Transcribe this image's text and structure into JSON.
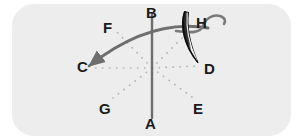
{
  "figure": {
    "name": "suture-needle-direction-diagram",
    "background_color": "#ededed",
    "outside_color": "#ffffff",
    "corner_radius": 22,
    "panel": {
      "x": 12,
      "y": 4,
      "width": 279,
      "height": 132
    }
  },
  "colors": {
    "panel_bg": "#ededed",
    "label_text": "#1a1a1a",
    "solid_line": "#6e6e6e",
    "dotted_line": "#b3b3b3",
    "needle_outline": "#111111",
    "needle_fill": "#f2f2f2",
    "thread": "#7a7a7a"
  },
  "labels": [
    {
      "id": "A",
      "text": "A",
      "x": 145,
      "y": 116,
      "name": "label-point-a"
    },
    {
      "id": "B",
      "text": "B",
      "x": 146,
      "y": 5,
      "name": "label-point-b"
    },
    {
      "id": "C",
      "text": "C",
      "x": 77,
      "y": 59,
      "name": "label-point-c"
    },
    {
      "id": "D",
      "text": "D",
      "x": 204,
      "y": 61,
      "name": "label-point-d"
    },
    {
      "id": "E",
      "text": "E",
      "x": 193,
      "y": 101,
      "name": "label-point-e"
    },
    {
      "id": "F",
      "text": "F",
      "x": 103,
      "y": 20,
      "name": "label-point-f"
    },
    {
      "id": "G",
      "text": "G",
      "x": 99,
      "y": 101,
      "name": "label-point-g"
    },
    {
      "id": "H",
      "text": "H",
      "x": 196,
      "y": 15,
      "name": "label-point-h"
    }
  ],
  "geometry": {
    "center": {
      "x": 152,
      "y": 68
    },
    "vertical_axis": {
      "from": {
        "x": 152,
        "y": 14
      },
      "to": {
        "x": 152,
        "y": 118
      }
    },
    "dotted_rays": [
      {
        "name": "ray-center-to-c",
        "to": {
          "x": 92,
          "y": 68
        }
      },
      {
        "name": "ray-center-to-d",
        "to": {
          "x": 200,
          "y": 66
        }
      },
      {
        "name": "ray-center-to-f",
        "to": {
          "x": 114,
          "y": 29
        }
      },
      {
        "name": "ray-center-to-e",
        "to": {
          "x": 192,
          "y": 97
        }
      },
      {
        "name": "ray-center-to-g",
        "to": {
          "x": 113,
          "y": 98
        }
      },
      {
        "name": "ray-center-to-h",
        "to": {
          "x": 190,
          "y": 30
        }
      }
    ],
    "needle_arc": {
      "name": "needle-travel-arc",
      "start": {
        "x": 89,
        "y": 66
      },
      "control": {
        "x": 150,
        "y": 18
      },
      "end": {
        "x": 208,
        "y": 28
      },
      "arrowhead_at": "C"
    },
    "needle_body": {
      "name": "curved-suture-needle",
      "tip": {
        "x": 198,
        "y": 63
      },
      "butt": {
        "x": 184,
        "y": 12
      }
    },
    "thread": {
      "name": "suture-thread",
      "from": {
        "x": 190,
        "y": 27
      },
      "to": {
        "x": 228,
        "y": 15
      }
    }
  }
}
